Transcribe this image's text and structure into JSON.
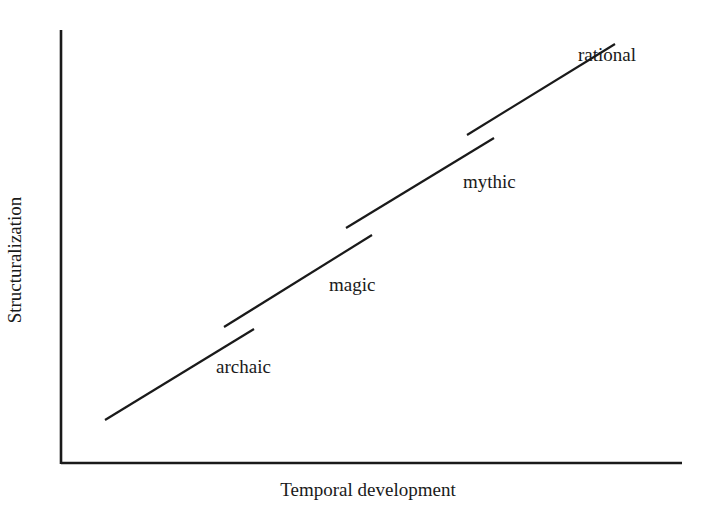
{
  "diagram": {
    "type": "staged-progression",
    "x_axis": {
      "label": "Temporal development",
      "line": {
        "x1": 61,
        "y1": 463,
        "x2": 682,
        "y2": 463
      }
    },
    "y_axis": {
      "label": "Structuralization",
      "line": {
        "x1": 61,
        "y1": 30,
        "x2": 61,
        "y2": 464
      }
    },
    "stages": [
      {
        "label": "archaic",
        "x1": 105,
        "y1": 420,
        "x2": 254,
        "y2": 329,
        "label_x": 216,
        "label_y": 373
      },
      {
        "label": "magic",
        "x1": 224,
        "y1": 327,
        "x2": 372,
        "y2": 235,
        "label_x": 329,
        "label_y": 291
      },
      {
        "label": "mythic",
        "x1": 346,
        "y1": 228,
        "x2": 494,
        "y2": 138,
        "label_x": 463,
        "label_y": 188
      },
      {
        "label": "rational",
        "x1": 467,
        "y1": 135,
        "x2": 615,
        "y2": 44,
        "label_x": 578,
        "label_y": 61
      }
    ],
    "colors": {
      "stroke": "#1a1a1a",
      "background": "#ffffff"
    }
  }
}
